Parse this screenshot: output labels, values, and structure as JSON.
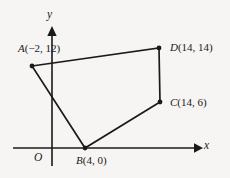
{
  "figure": {
    "background_color": "#f6f5f3",
    "ink_color": "#1a1a18",
    "axes": {
      "x_axis_label": "x",
      "y_axis_label": "y",
      "origin_label": "O"
    },
    "shape": {
      "name": "quadrilateral-ABCD",
      "vertices": [
        {
          "id": "A",
          "label": "A(−2, 12)",
          "point_name": "A",
          "coords": [
            -2,
            12
          ],
          "px": [
            32,
            66
          ]
        },
        {
          "id": "B",
          "label": "B(4, 0)",
          "point_name": "B",
          "coords": [
            4,
            0
          ],
          "px": [
            85,
            148
          ]
        },
        {
          "id": "C",
          "label": "C(14, 6)",
          "point_name": "C",
          "coords": [
            14,
            6
          ],
          "px": [
            160,
            102
          ]
        },
        {
          "id": "D",
          "label": "D(14, 14)",
          "point_name": "D",
          "coords": [
            14,
            14
          ],
          "px": [
            159,
            48
          ]
        }
      ],
      "edges": [
        [
          "A",
          "D"
        ],
        [
          "D",
          "C"
        ],
        [
          "C",
          "B"
        ],
        [
          "B",
          "A"
        ]
      ]
    }
  },
  "chart_data": {
    "type": "scatter",
    "title": "",
    "xlabel": "x",
    "ylabel": "y",
    "grid": false,
    "legend": null,
    "xlim": [
      -6,
      18
    ],
    "ylim": [
      -2,
      17
    ],
    "series": [
      {
        "name": "Quadrilateral ABCD",
        "point_labels": [
          "A(−2, 12)",
          "B(4, 0)",
          "C(14, 6)",
          "D(14, 14)"
        ],
        "x": [
          -2,
          4,
          14,
          14
        ],
        "y": [
          12,
          0,
          6,
          14
        ],
        "closed_polygon": true
      }
    ],
    "annotations": [
      "O"
    ]
  }
}
